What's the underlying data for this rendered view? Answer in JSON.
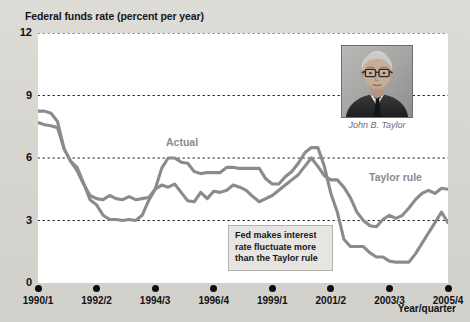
{
  "title": "Federal funds rate (percent per year)",
  "axis": {
    "x_title": "Year/quarter"
  },
  "annotation": {
    "line1": "Fed makes interest",
    "line2": "rate fluctuate more",
    "line3": "than the Taylor rule"
  },
  "portrait": {
    "caption": "John B. Taylor",
    "alt": "portrait-photo"
  },
  "labels": {
    "actual": "Actual",
    "taylor": "Taylor rule"
  },
  "colors": {
    "line": "#8b8b8b",
    "plot_background": "#ffffff",
    "page_background": "#d9d8d4",
    "grid": "#1a1a1a",
    "text": "#111114",
    "callout_fill": "#e6e5e1",
    "callout_border": "#b4b3ae"
  },
  "chart_data": {
    "type": "line",
    "title": "Federal funds rate (percent per year)",
    "xlabel": "Year/quarter",
    "ylabel": "Federal funds rate (percent per year)",
    "ylim": [
      0,
      12
    ],
    "yticks": [
      0,
      3,
      6,
      9,
      12
    ],
    "ytick_labels": [
      "0",
      "3",
      "6",
      "9",
      "12"
    ],
    "grid": "horizontal-dotted",
    "legend": "inline-labels",
    "xtick_labels": [
      "1990/1",
      "1992/2",
      "1994/3",
      "1996/4",
      "1999/1",
      "2001/2",
      "2003/3",
      "2005/4"
    ],
    "xtick_positions": [
      0,
      9,
      18,
      27,
      36,
      45,
      54,
      63
    ],
    "x": [
      "1990/1",
      "1990/2",
      "1990/3",
      "1990/4",
      "1991/1",
      "1991/2",
      "1991/3",
      "1991/4",
      "1992/1",
      "1992/2",
      "1992/3",
      "1992/4",
      "1993/1",
      "1993/2",
      "1993/3",
      "1993/4",
      "1994/1",
      "1994/2",
      "1994/3",
      "1994/4",
      "1995/1",
      "1995/2",
      "1995/3",
      "1995/4",
      "1996/1",
      "1996/2",
      "1996/3",
      "1996/4",
      "1997/1",
      "1997/2",
      "1997/3",
      "1997/4",
      "1998/1",
      "1998/2",
      "1998/3",
      "1998/4",
      "1999/1",
      "1999/2",
      "1999/3",
      "1999/4",
      "2000/1",
      "2000/2",
      "2000/3",
      "2000/4",
      "2001/1",
      "2001/2",
      "2001/3",
      "2001/4",
      "2002/1",
      "2002/2",
      "2002/3",
      "2002/4",
      "2003/1",
      "2003/2",
      "2003/3",
      "2003/4",
      "2004/1",
      "2004/2",
      "2004/3",
      "2004/4",
      "2005/1",
      "2005/2",
      "2005/3",
      "2005/4"
    ],
    "series": [
      {
        "name": "Actual",
        "values": [
          8.25,
          8.25,
          8.15,
          7.75,
          6.45,
          5.85,
          5.55,
          4.8,
          4.0,
          3.75,
          3.25,
          3.05,
          3.05,
          3.0,
          3.05,
          3.0,
          3.25,
          3.95,
          4.5,
          5.5,
          6.0,
          6.0,
          5.8,
          5.75,
          5.35,
          5.25,
          5.3,
          5.3,
          5.3,
          5.55,
          5.55,
          5.5,
          5.5,
          5.5,
          5.5,
          5.0,
          4.75,
          4.75,
          5.1,
          5.35,
          5.75,
          6.25,
          6.5,
          6.5,
          5.6,
          4.3,
          3.4,
          2.1,
          1.75,
          1.75,
          1.75,
          1.45,
          1.25,
          1.25,
          1.05,
          1.0,
          1.0,
          1.0,
          1.4,
          1.9,
          2.4,
          2.9,
          3.4,
          2.9
        ]
      },
      {
        "name": "Taylor rule",
        "values": [
          7.7,
          7.6,
          7.55,
          7.45,
          6.45,
          5.85,
          5.4,
          4.75,
          4.2,
          4.05,
          4.0,
          4.2,
          4.05,
          4.0,
          4.15,
          4.0,
          4.05,
          4.1,
          4.5,
          4.7,
          4.6,
          4.75,
          4.35,
          3.95,
          3.9,
          4.35,
          4.05,
          4.4,
          4.35,
          4.45,
          4.7,
          4.6,
          4.45,
          4.15,
          3.9,
          4.05,
          4.2,
          4.45,
          4.7,
          4.95,
          5.2,
          5.6,
          6.0,
          5.6,
          5.15,
          4.95,
          4.95,
          4.6,
          4.1,
          3.4,
          3.0,
          2.75,
          2.7,
          3.05,
          3.25,
          3.1,
          3.25,
          3.6,
          4.0,
          4.3,
          4.45,
          4.3,
          4.55,
          4.5
        ]
      }
    ]
  }
}
